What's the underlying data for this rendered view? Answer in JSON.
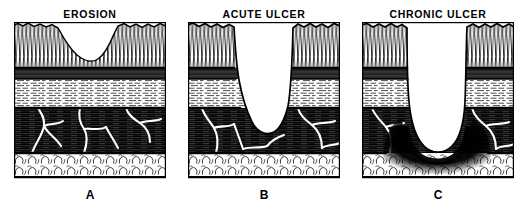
{
  "figure": {
    "caption_style": "three-panel comparative histology diagram",
    "background_color": "#ffffff",
    "ink_color": "#000000"
  },
  "panels": [
    {
      "id": "erosion",
      "title": "EROSION",
      "letter": "A",
      "defect_depth": "mucosa only",
      "defect_shape": "shallow broad saucer"
    },
    {
      "id": "acute-ulcer",
      "title": "ACUTE ULCER",
      "letter": "B",
      "defect_depth": "through submucosa into muscularis propria",
      "defect_shape": "steep-walled narrow crater"
    },
    {
      "id": "chronic-ulcer",
      "title": "CHRONIC ULCER",
      "letter": "C",
      "defect_depth": "through muscularis propria to serosa with fibrotic base",
      "defect_shape": "deep U-shaped crater with dense scar"
    }
  ],
  "layers": [
    {
      "name": "mucosa",
      "texture": "vertical glandular hatching"
    },
    {
      "name": "muscularis-mucosae",
      "texture": "solid dark band"
    },
    {
      "name": "submucosa",
      "texture": "fine horizontal dashes"
    },
    {
      "name": "muscularis-propria",
      "texture": "dark bundles with white vessels"
    },
    {
      "name": "serosa",
      "texture": "squiggly adipose cell outlines"
    }
  ]
}
